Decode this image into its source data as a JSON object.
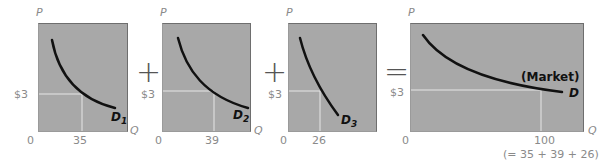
{
  "panels": [
    {
      "id": "d1",
      "price_label": "$3",
      "origin": "0",
      "q_tick": "35",
      "curve_label": "D",
      "curve_sub": "1",
      "y_axis": "P",
      "x_axis": "Q"
    },
    {
      "id": "d2",
      "price_label": "$3",
      "origin": "0",
      "q_tick": "39",
      "curve_label": "D",
      "curve_sub": "2",
      "y_axis": "P",
      "x_axis": "Q"
    },
    {
      "id": "d3",
      "price_label": "$3",
      "origin": "0",
      "q_tick": "26",
      "curve_label": "D",
      "curve_sub": "3",
      "y_axis": "P",
      "x_axis": "Q"
    },
    {
      "id": "market",
      "price_label": "$3",
      "origin": "0",
      "q_tick": "100",
      "curve_label": "D",
      "market_label": "(Market)",
      "sum_note": "(= 35 + 39 + 26)",
      "y_axis": "P",
      "x_axis": "Q"
    }
  ],
  "operators": {
    "plus1": "+",
    "plus2": "+",
    "equals": "="
  },
  "colors": {
    "panel_bg": "#a8a8a8",
    "curve": "#111111",
    "guide": "#e6e6e6",
    "text": "#8a8a8a"
  }
}
